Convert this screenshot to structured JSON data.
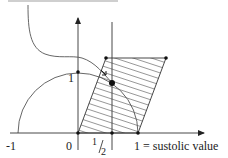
{
  "diagram": {
    "caption_partial": "",
    "labels": {
      "x_neg_one": "-1",
      "x_zero": "0",
      "x_half_num": "1",
      "x_half_den": "2",
      "x_one": "1 = sustolic value",
      "y_one": "1"
    },
    "colors": {
      "stroke": "#333333",
      "curve": "#555555",
      "hatch": "#666666",
      "point": "#111111",
      "background": "#ffffff"
    },
    "elements": [
      {
        "type": "axis",
        "direction": "horizontal",
        "from": [
          10,
          133
        ],
        "to": [
          206,
          133
        ],
        "arrow": true
      },
      {
        "type": "axis",
        "direction": "vertical",
        "from": [
          78,
          150
        ],
        "to": [
          78,
          16
        ],
        "arrow": true
      },
      {
        "type": "line",
        "name": "half-marker",
        "from": [
          112,
          150
        ],
        "to": [
          112,
          22
        ]
      },
      {
        "type": "semicircle",
        "center": [
          78,
          133
        ],
        "radius": 60
      },
      {
        "type": "parallelogram",
        "vertices": [
          [
            78,
            133
          ],
          [
            138,
            133
          ],
          [
            166,
            58
          ],
          [
            106,
            58
          ]
        ],
        "hatched": true
      },
      {
        "type": "curve",
        "name": "decay-curve",
        "from": [
          28,
          5
        ],
        "to": [
          112,
          83
        ]
      },
      {
        "type": "points",
        "coords": [
          [
            78,
            133
          ],
          [
            112,
            133
          ],
          [
            138,
            133
          ],
          [
            78,
            72
          ],
          [
            106,
            58
          ],
          [
            166,
            58
          ],
          [
            112,
            83
          ]
        ]
      }
    ]
  }
}
